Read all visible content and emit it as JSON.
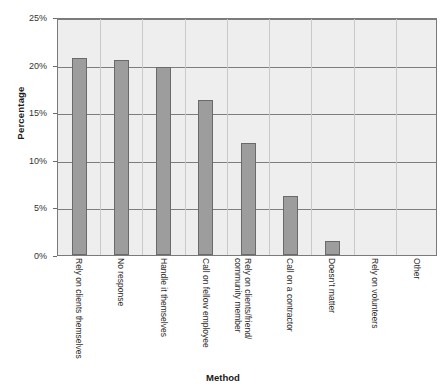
{
  "chart_data": {
    "type": "bar",
    "title": "",
    "xlabel": "Method",
    "ylabel": "Percentage",
    "categories": [
      "Rely on clients themselves",
      "No response",
      "Handle it themselves",
      "Call on fellow employee",
      "Rely on clients/friend/ community member",
      "Call on a contractor",
      "Doesn't matter",
      "Rely on volunteers",
      "Other"
    ],
    "values": [
      20.7,
      20.5,
      19.8,
      16.3,
      11.8,
      6.2,
      1.5,
      0,
      0
    ],
    "ylim": [
      0,
      25
    ],
    "yticks": [
      0,
      5,
      10,
      15,
      20,
      25
    ],
    "ytick_labels": [
      "0%",
      "5%",
      "10%",
      "15%",
      "20%",
      "25%"
    ],
    "grid": true,
    "legend": "none",
    "colors": {
      "bar_fill": "#9d9d9d",
      "bar_border": "#6a6a6a",
      "plot_background": "#eeeeee",
      "gridline": "#7d7d7d",
      "axis_border": "#7a7a7a",
      "text": "#1a1a1a"
    }
  }
}
